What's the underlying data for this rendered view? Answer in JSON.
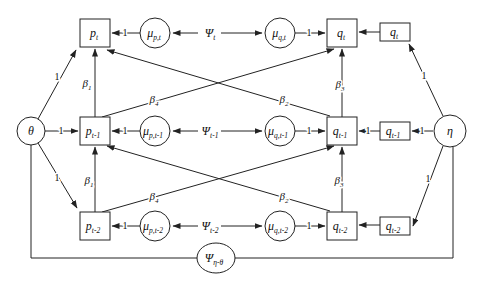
{
  "figure": {
    "type": "structural-equation-path-diagram",
    "background": "#ffffff",
    "line_color": "#222222"
  },
  "nodes": {
    "theta": {
      "main": "θ"
    },
    "eta": {
      "main": "η"
    },
    "p_t": {
      "main": "p",
      "sub": "t"
    },
    "p_t1": {
      "main": "p",
      "sub": "t-1"
    },
    "p_t2": {
      "main": "p",
      "sub": "t-2"
    },
    "mu_p_t": {
      "main": "μ",
      "sub": "p,t"
    },
    "mu_p_t1": {
      "main": "μ",
      "sub": "p,t-1"
    },
    "mu_p_t2": {
      "main": "μ",
      "sub": "p,t-2"
    },
    "psi_t": {
      "main": "Ψ",
      "sub": "t"
    },
    "psi_t1": {
      "main": "Ψ",
      "sub": "t-1"
    },
    "psi_t2": {
      "main": "Ψ",
      "sub": "t-2"
    },
    "mu_q_t": {
      "main": "μ",
      "sub": "q,t"
    },
    "mu_q_t1": {
      "main": "μ",
      "sub": "q,t-1"
    },
    "mu_q_t2": {
      "main": "μ",
      "sub": "q,t-2"
    },
    "q_t": {
      "main": "q",
      "sub": "t"
    },
    "q_t1": {
      "main": "q",
      "sub": "t-1"
    },
    "q_t2": {
      "main": "q",
      "sub": "t-2"
    },
    "q_t_ind": {
      "main": "q",
      "sub": "t"
    },
    "q_t1_ind": {
      "main": "q",
      "sub": "t-1"
    },
    "q_t2_ind": {
      "main": "q",
      "sub": "t-2"
    },
    "psi_eta_theta": {
      "main": "Ψ",
      "sub": "η-θ"
    }
  },
  "labels": {
    "one": "1",
    "beta1": {
      "main": "β",
      "sub": "1"
    },
    "beta2": {
      "main": "β",
      "sub": "2"
    },
    "beta3": {
      "main": "β",
      "sub": "3"
    },
    "beta4": {
      "main": "β",
      "sub": "4"
    }
  }
}
